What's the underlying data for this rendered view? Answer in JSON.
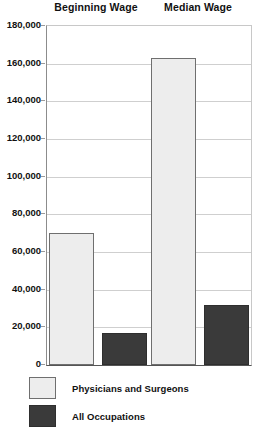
{
  "chart_data": {
    "type": "bar",
    "title": "",
    "xlabel": "",
    "ylabel": "",
    "categories": [
      "Beginning Wage",
      "Median Wage"
    ],
    "series": [
      {
        "name": "Physicians and Surgeons",
        "color": "#ededed",
        "values": [
          70000,
          163000
        ]
      },
      {
        "name": "All Occupations",
        "color": "#3a3a3a",
        "values": [
          17000,
          32000
        ]
      }
    ],
    "ylim": [
      0,
      180000
    ],
    "ytick_values": [
      0,
      20000,
      40000,
      60000,
      80000,
      100000,
      120000,
      140000,
      160000,
      180000
    ],
    "ytick_labels": [
      "0",
      "20,000",
      "40,000",
      "60,000",
      "80,000",
      "100,000",
      "120,000",
      "140,000",
      "160,000",
      "180,000"
    ],
    "grid": true,
    "legend_position": "bottom-left"
  },
  "groups": [
    {
      "label": "Beginning Wage"
    },
    {
      "label": "Median Wage"
    }
  ],
  "legend": {
    "entries": [
      {
        "label": "Physicians and Surgeons",
        "swatch": "light"
      },
      {
        "label": "All Occupations",
        "swatch": "dark"
      }
    ]
  }
}
